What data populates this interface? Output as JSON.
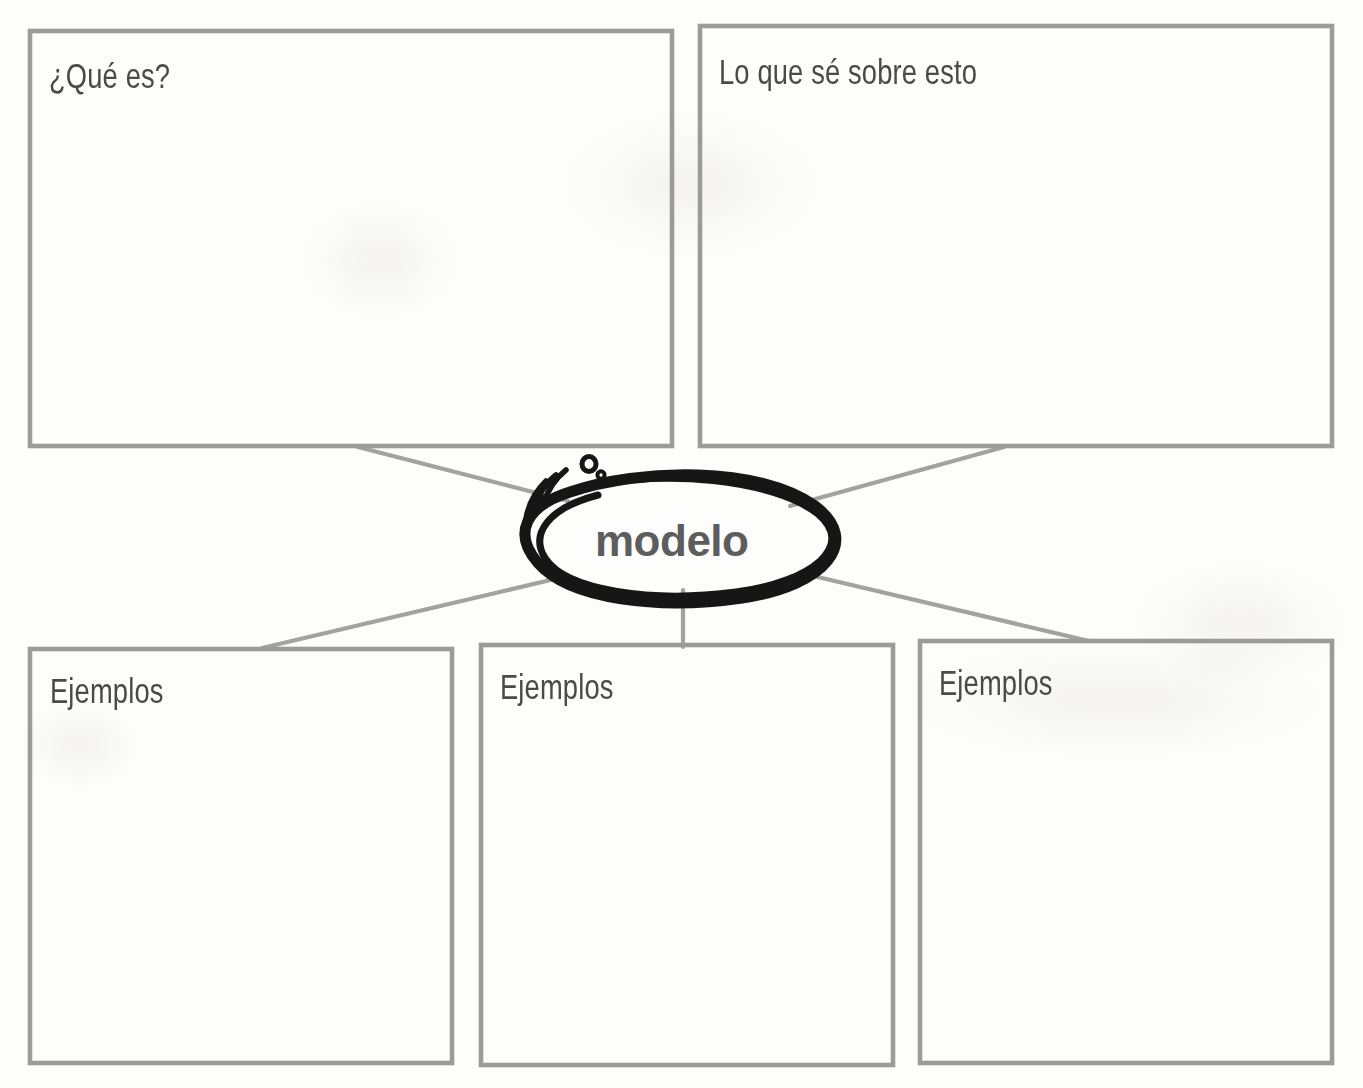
{
  "worksheet": {
    "type": "graphic-organizer",
    "language": "es",
    "center_term": "modelo",
    "boxes": [
      {
        "id": "que-es",
        "label": "¿Qué es?",
        "row": "top",
        "x": 30,
        "y": 31,
        "w": 642,
        "h": 415
      },
      {
        "id": "lo-que-se",
        "label": "Lo que sé sobre esto",
        "row": "top",
        "x": 700,
        "y": 26,
        "w": 632,
        "h": 420
      },
      {
        "id": "ejemplos-1",
        "label": "Ejemplos",
        "row": "bottom",
        "x": 30,
        "y": 649,
        "w": 422,
        "h": 414
      },
      {
        "id": "ejemplos-2",
        "label": "Ejemplos",
        "row": "bottom",
        "x": 481,
        "y": 645,
        "w": 412,
        "h": 420
      },
      {
        "id": "ejemplos-3",
        "label": "Ejemplos",
        "row": "bottom",
        "x": 920,
        "y": 641,
        "w": 412,
        "h": 422
      }
    ],
    "connectors": [
      {
        "id": "connector-top-left",
        "from": "que-es",
        "to": "center",
        "x1": 358,
        "y1": 446,
        "x2": 566,
        "y2": 500
      },
      {
        "id": "connector-top-right",
        "from": "lo-que-se",
        "to": "center",
        "x1": 1004,
        "y1": 446,
        "x2": 791,
        "y2": 505
      },
      {
        "id": "connector-bottom-left",
        "from": "ejemplos-1",
        "to": "center",
        "x1": 262,
        "y1": 648,
        "x2": 557,
        "y2": 578
      },
      {
        "id": "connector-bottom-mid",
        "from": "ejemplos-2",
        "to": "center",
        "x1": 683,
        "y1": 645,
        "x2": 683,
        "y2": 592
      },
      {
        "id": "connector-bottom-right",
        "from": "ejemplos-3",
        "to": "center",
        "x1": 1089,
        "y1": 641,
        "x2": 806,
        "y2": 574
      }
    ],
    "oval": {
      "cx": 681,
      "cy": 537,
      "rx": 146,
      "ry": 59,
      "style": "hand-drawn-lasso",
      "decorations": [
        "bubble-large",
        "bubble-small",
        "motion-line-1",
        "motion-line-2",
        "motion-line-3"
      ]
    },
    "colors": {
      "box_stroke": "#9b9b9b",
      "connector_stroke": "#a2a2a2",
      "label_text": "#4a4a4a",
      "center_text": "#5d5d5d",
      "oval_stroke": "#151515",
      "page_background": "#fdfdfc"
    },
    "scan_artifacts": {
      "note": "faint bleed-through ghost text from reverse of page",
      "marks": [
        "ghost-mark-1",
        "ghost-mark-2",
        "ghost-mark-3",
        "ghost-mark-4",
        "ghost-mark-5"
      ]
    }
  }
}
